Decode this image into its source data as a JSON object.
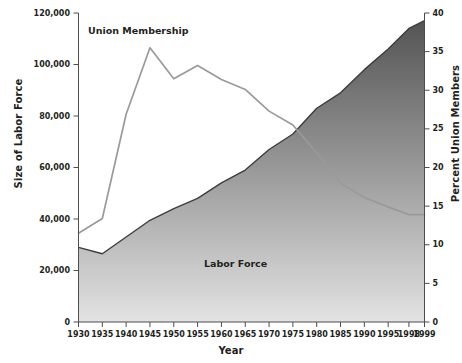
{
  "chart_data": {
    "type": "area",
    "title": "",
    "xlabel": "Year",
    "ylabel": "Size of Labor Force",
    "ylabel_right": "Percent Union Members",
    "x": [
      1930,
      1935,
      1940,
      1945,
      1950,
      1955,
      1960,
      1965,
      1970,
      1975,
      1980,
      1985,
      1990,
      1995,
      1998,
      1999
    ],
    "xtick_labels": [
      "1930",
      "1935",
      "1940",
      "1945",
      "1950",
      "1955",
      "1960",
      "1965",
      "1970",
      "1975",
      "1980",
      "1985",
      "1990",
      "1995",
      "1998",
      "1999"
    ],
    "ylim": [
      0,
      120000
    ],
    "ytick_labels": [
      "0",
      "20,000",
      "40,000",
      "60,000",
      "80,000",
      "100,000",
      "120,000"
    ],
    "ytick_values": [
      0,
      20000,
      40000,
      60000,
      80000,
      100000,
      120000
    ],
    "ylim_right": [
      0,
      40
    ],
    "ytick_right_labels": [
      "0",
      "5",
      "10",
      "15",
      "20",
      "25",
      "30",
      "35",
      "40"
    ],
    "ytick_right_values": [
      0,
      5,
      10,
      15,
      20,
      25,
      30,
      35,
      40
    ],
    "grid": false,
    "legend_position": "inline-annotations",
    "series": [
      {
        "name": "Labor Force",
        "kind": "area",
        "axis": "left",
        "units": "thousands of workers",
        "label": "Labor Force",
        "color": "#7d7d7d",
        "values": [
          29000,
          26500,
          33000,
          39500,
          44000,
          48000,
          54000,
          59000,
          67000,
          73000,
          83000,
          89000,
          98000,
          106000,
          114000,
          117000
        ]
      },
      {
        "name": "Union Membership",
        "kind": "line",
        "axis": "right",
        "units": "percent of labor force",
        "label": "Union Membership",
        "color": "#8c8c8c",
        "values": [
          11.5,
          13.4,
          26.9,
          35.5,
          31.5,
          33.2,
          31.4,
          30.1,
          27.3,
          25.5,
          21.9,
          18.0,
          16.1,
          14.9,
          13.9,
          13.9
        ]
      }
    ],
    "annotations": [
      {
        "text": "Union Membership",
        "x": 1938,
        "y_right": 38.5
      },
      {
        "text": "Labor Force",
        "x": 1966,
        "y_left": 21000
      }
    ]
  }
}
